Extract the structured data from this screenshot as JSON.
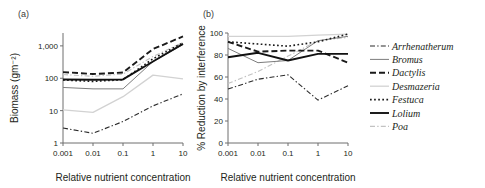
{
  "figure": {
    "panels": [
      {
        "id": "panel-a",
        "label": "(a)",
        "xlabel": "Relative nutrient concentration",
        "ylabel": "Biomass (gm⁻²)"
      },
      {
        "id": "panel-b",
        "label": "(b)",
        "xlabel": "Relative nutrient concentration",
        "ylabel": "% Reduction by interference"
      }
    ]
  },
  "legend": {
    "position": "right",
    "items": [
      {
        "name": "Arrhenatherum",
        "style": "dashdot",
        "color": "#2b2b2b",
        "width": 1.1
      },
      {
        "name": "Bromus",
        "style": "solid",
        "color": "#7d7d7d",
        "width": 1.0
      },
      {
        "name": "Dactylis",
        "style": "dashed",
        "color": "#1a1a1a",
        "width": 1.9
      },
      {
        "name": "Desmazeria",
        "style": "solid",
        "color": "#d2d2d2",
        "width": 1.3
      },
      {
        "name": "Festuca",
        "style": "dotted",
        "color": "#1a1a1a",
        "width": 1.6
      },
      {
        "name": "Lolium",
        "style": "solid",
        "color": "#111111",
        "width": 1.9
      },
      {
        "name": "Poa",
        "style": "dashdot",
        "color": "#c2c2c2",
        "width": 1.1
      }
    ]
  },
  "chart_data": [
    {
      "type": "line",
      "id": "panel-a",
      "title": "(a)",
      "xlabel": "Relative nutrient concentration",
      "ylabel": "Biomass (gm⁻²)",
      "xscale": "log",
      "yscale": "log",
      "x": [
        0.001,
        0.01,
        0.1,
        1,
        10
      ],
      "xtick_labels": [
        "0.001",
        "0.01",
        "0.1",
        "1",
        "10"
      ],
      "ytick_values": [
        1,
        10,
        100,
        1000
      ],
      "ytick_labels": [
        "1",
        "10",
        "100",
        "1,000"
      ],
      "xlim": [
        0.001,
        10
      ],
      "ylim": [
        1,
        2500
      ],
      "grid": false,
      "legend_position": "right",
      "series": [
        {
          "name": "Arrhenatherum",
          "values": [
            2.9,
            2.0,
            4.6,
            14,
            33
          ]
        },
        {
          "name": "Bromus",
          "values": [
            52,
            47,
            47,
            330,
            1100
          ]
        },
        {
          "name": "Dactylis",
          "values": [
            155,
            135,
            150,
            800,
            1950
          ]
        },
        {
          "name": "Desmazeria",
          "values": [
            10.5,
            8.8,
            27,
            125,
            95
          ]
        },
        {
          "name": "Festuca",
          "values": [
            88,
            80,
            90,
            400,
            1250
          ]
        },
        {
          "name": "Lolium",
          "values": [
            92,
            90,
            92,
            330,
            1150
          ]
        },
        {
          "name": "Poa",
          "values": [
            130,
            115,
            135,
            470,
            1280
          ]
        }
      ]
    },
    {
      "type": "line",
      "id": "panel-b",
      "title": "(b)",
      "xlabel": "Relative nutrient concentration",
      "ylabel": "% Reduction by interference",
      "xscale": "log",
      "yscale": "linear",
      "x": [
        0.001,
        0.01,
        0.1,
        1,
        10
      ],
      "xtick_labels": [
        "0.001",
        "0.01",
        "0.1",
        "1",
        "10"
      ],
      "ytick_values": [
        0,
        20,
        40,
        60,
        80,
        100
      ],
      "ytick_labels": [
        "0",
        "20",
        "40",
        "60",
        "80",
        "100"
      ],
      "xlim": [
        0.001,
        10
      ],
      "ylim": [
        0,
        100
      ],
      "grid": false,
      "legend_position": "right",
      "series": [
        {
          "name": "Arrhenatherum",
          "values": [
            49,
            58,
            62,
            39,
            52
          ]
        },
        {
          "name": "Bromus",
          "values": [
            86,
            73,
            75,
            93,
            97
          ]
        },
        {
          "name": "Dactylis",
          "values": [
            92,
            83,
            84,
            84,
            73
          ]
        },
        {
          "name": "Desmazeria",
          "values": [
            97,
            97,
            97,
            98,
            99
          ]
        },
        {
          "name": "Festuca",
          "values": [
            92,
            90,
            88,
            92,
            99
          ]
        },
        {
          "name": "Lolium",
          "values": [
            78,
            82,
            75,
            81,
            81
          ]
        },
        {
          "name": "Poa",
          "values": [
            54,
            65,
            79,
            93,
            96
          ]
        }
      ]
    }
  ]
}
